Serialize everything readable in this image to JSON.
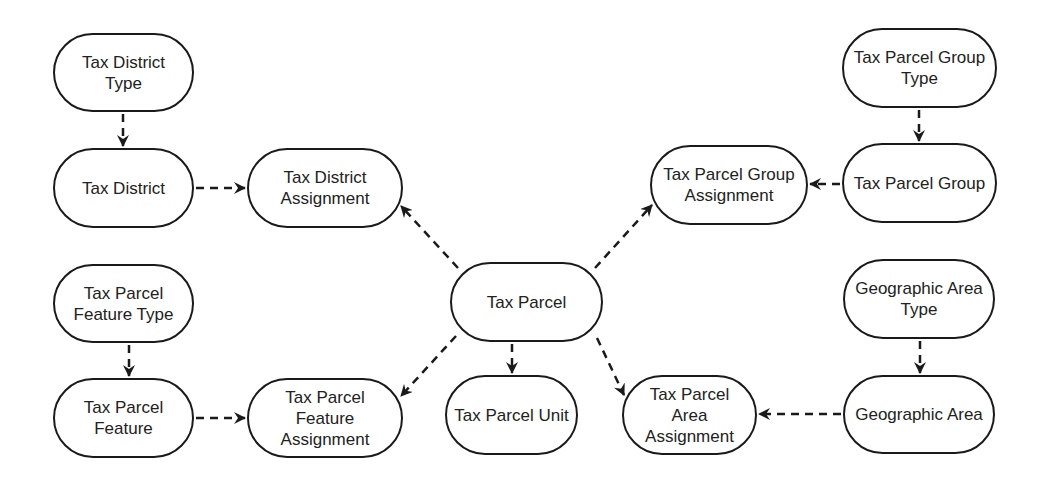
{
  "diagram": {
    "type": "entity-relationship",
    "colors": {
      "stroke": "#1a1a1a",
      "text": "#222222",
      "background": "#ffffff"
    },
    "nodes": [
      {
        "id": "tax_district_type",
        "label": "Tax District\nType",
        "x": 53,
        "y": 33,
        "w": 141,
        "h": 79
      },
      {
        "id": "tax_district",
        "label": "Tax District",
        "x": 53,
        "y": 148,
        "w": 141,
        "h": 80
      },
      {
        "id": "tax_district_assignment",
        "label": "Tax District\nAssignment",
        "x": 247,
        "y": 148,
        "w": 156,
        "h": 80
      },
      {
        "id": "tax_parcel_feature_type",
        "label": "Tax Parcel\nFeature Type",
        "x": 53,
        "y": 264,
        "w": 141,
        "h": 79
      },
      {
        "id": "tax_parcel_feature",
        "label": "Tax Parcel\nFeature",
        "x": 53,
        "y": 378,
        "w": 141,
        "h": 80
      },
      {
        "id": "tax_parcel_feature_assignment",
        "label": "Tax Parcel\nFeature\nAssignment",
        "x": 247,
        "y": 378,
        "w": 156,
        "h": 80
      },
      {
        "id": "tax_parcel",
        "label": "Tax Parcel",
        "x": 450,
        "y": 262,
        "w": 153,
        "h": 80
      },
      {
        "id": "tax_parcel_unit",
        "label": "Tax Parcel Unit",
        "x": 445,
        "y": 375,
        "w": 133,
        "h": 80
      },
      {
        "id": "tax_parcel_group_type",
        "label": "Tax Parcel Group\nType",
        "x": 842,
        "y": 28,
        "w": 155,
        "h": 80
      },
      {
        "id": "tax_parcel_group",
        "label": "Tax Parcel Group",
        "x": 842,
        "y": 143,
        "w": 155,
        "h": 80
      },
      {
        "id": "tax_parcel_group_assignment",
        "label": "Tax Parcel Group\nAssignment",
        "x": 650,
        "y": 145,
        "w": 158,
        "h": 80
      },
      {
        "id": "geographic_area_type",
        "label": "Geographic Area\nType",
        "x": 843,
        "y": 259,
        "w": 152,
        "h": 80
      },
      {
        "id": "geographic_area",
        "label": "Geographic Area",
        "x": 843,
        "y": 375,
        "w": 152,
        "h": 79
      },
      {
        "id": "tax_parcel_area_assignment",
        "label": "Tax Parcel Area\nAssignment",
        "x": 622,
        "y": 375,
        "w": 135,
        "h": 80
      }
    ],
    "edges": [
      {
        "from": "tax_district_type",
        "to": "tax_district",
        "style": "dashed",
        "x1": 123,
        "y1": 114,
        "x2": 123,
        "y2": 146
      },
      {
        "from": "tax_district",
        "to": "tax_district_assignment",
        "style": "dashed",
        "x1": 196,
        "y1": 188,
        "x2": 245,
        "y2": 188
      },
      {
        "from": "tax_parcel_feature_type",
        "to": "tax_parcel_feature",
        "style": "dashed",
        "x1": 129,
        "y1": 345,
        "x2": 129,
        "y2": 376
      },
      {
        "from": "tax_parcel_feature",
        "to": "tax_parcel_feature_assignment",
        "style": "dashed",
        "x1": 196,
        "y1": 418,
        "x2": 245,
        "y2": 418
      },
      {
        "from": "tax_parcel",
        "to": "tax_district_assignment",
        "style": "dashed",
        "x1": 458,
        "y1": 268,
        "x2": 401,
        "y2": 206
      },
      {
        "from": "tax_parcel",
        "to": "tax_parcel_group_assignment",
        "style": "dashed",
        "x1": 595,
        "y1": 268,
        "x2": 652,
        "y2": 205
      },
      {
        "from": "tax_parcel",
        "to": "tax_parcel_feature_assignment",
        "style": "dashed",
        "x1": 456,
        "y1": 336,
        "x2": 401,
        "y2": 396
      },
      {
        "from": "tax_parcel",
        "to": "tax_parcel_unit",
        "style": "dashed",
        "x1": 512,
        "y1": 344,
        "x2": 512,
        "y2": 373
      },
      {
        "from": "tax_parcel",
        "to": "tax_parcel_area_assignment",
        "style": "dashed",
        "x1": 597,
        "y1": 338,
        "x2": 624,
        "y2": 395
      },
      {
        "from": "tax_parcel_group_type",
        "to": "tax_parcel_group",
        "style": "dashed",
        "x1": 919,
        "y1": 110,
        "x2": 919,
        "y2": 141
      },
      {
        "from": "tax_parcel_group",
        "to": "tax_parcel_group_assignment",
        "style": "dashed",
        "x1": 840,
        "y1": 184,
        "x2": 810,
        "y2": 184
      },
      {
        "from": "geographic_area_type",
        "to": "geographic_area",
        "style": "dashed",
        "x1": 920,
        "y1": 341,
        "x2": 920,
        "y2": 373
      },
      {
        "from": "geographic_area",
        "to": "tax_parcel_area_assignment",
        "style": "dashed",
        "x1": 841,
        "y1": 414,
        "x2": 759,
        "y2": 414
      }
    ]
  }
}
